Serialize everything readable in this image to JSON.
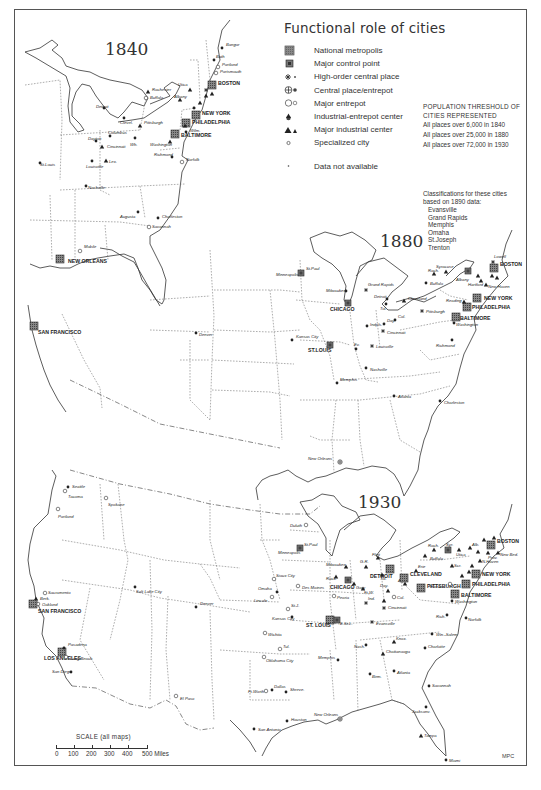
{
  "title": "Functional role of cities",
  "legend": [
    {
      "symbol": "national-metropolis",
      "label": "National metropolis"
    },
    {
      "symbol": "major-control-point",
      "label": "Major control point"
    },
    {
      "symbol": "high-order-central-place",
      "label": "High-order central place"
    },
    {
      "symbol": "central-place-entrepot",
      "label": "Central place/entrepot"
    },
    {
      "symbol": "major-entrepot",
      "label": "Major entrepot"
    },
    {
      "symbol": "industrial-entrepot-center",
      "label": "Industrial-entrepot center"
    },
    {
      "symbol": "major-industrial-center",
      "label": "Major industrial center"
    },
    {
      "symbol": "specialized-city",
      "label": "Specialized city"
    },
    {
      "symbol": "data-not-available",
      "label": "Data not available"
    }
  ],
  "threshold": {
    "heading_line1": "POPULATION THRESHOLD OF",
    "heading_line2": "CITIES REPRESENTED",
    "rows": [
      "All places over 6,000 in 1840",
      "All places over 25,000 in 1880",
      "All places over 72,000 in 1930"
    ]
  },
  "classifications": {
    "heading_line1": "Classifications for these cities",
    "heading_line2": "based on 1890 data:",
    "cities": [
      "Evansville",
      "Grand Rapids",
      "Memphis",
      "Omaha",
      "St.Joseph",
      "Trenton"
    ]
  },
  "maps": {
    "m1840": {
      "year": "1840",
      "cities": {
        "new_york": "NEW YORK",
        "philadelphia": "PHILADELPHIA",
        "baltimore": "BALTIMORE",
        "boston": "BOSTON",
        "new_orleans": "NEW ORLEANS",
        "san_francisco": "SAN FRANCISCO",
        "buffalo": "Buffalo",
        "rochester": "Rochester",
        "albany": "Albany",
        "utica": "Utica",
        "troy": "Troy",
        "pittsburgh": "Pittsburgh",
        "cleveland": "Clevel.",
        "detroit": "Detroit",
        "cincinnati": "Cincinnati",
        "louisville": "Louisville",
        "lexington": "Lex.",
        "st_louis": "St.Louis",
        "columbus": "Columbus",
        "dayton": "Dayton",
        "wheeling": "Wh.",
        "washington": "Washington",
        "richmond": "Richmond",
        "norfolk": "Norfolk",
        "nashville": "Nashville",
        "augusta": "Augusta",
        "charleston": "Charleston",
        "savannah": "Savannah",
        "mobile": "Mobile",
        "denver": "Denver",
        "portland": "Portland",
        "bangor": "Bangor",
        "bath": "Bath",
        "portsmouth": "Portsmouth",
        "salem": "Salem",
        "lowell": "Lowell",
        "providence": "Prov.",
        "newport": "New.",
        "hartford": "Hartf.",
        "new_haven": "N.Haven",
        "newark": "Newark",
        "lancaster": "Lanc.",
        "wilmington": "Wilm."
      }
    },
    "m1880": {
      "year": "1880",
      "cities": {
        "chicago": "CHICAGO",
        "st_louis": "ST.LOUIS",
        "new_york": "NEW YORK",
        "philadelphia": "PHILADELPHIA",
        "baltimore": "BALTIMORE",
        "boston": "BOSTON",
        "minneapolis": "Minneapolis",
        "st_paul": "St.Paul",
        "milwaukee": "Milwaukee",
        "grand_rapids": "Grand Rapids",
        "detroit": "Detroit",
        "toledo": "Tol.",
        "cleveland": "Cleveland",
        "buffalo": "Buffalo",
        "syracuse": "Syracuse",
        "rochester": "Roch.",
        "albany": "Albany",
        "pittsburgh": "Pittsburgh",
        "cincinnati": "Cincinnati",
        "indianapolis": "Indpls.",
        "dayton": "Day.",
        "columbus": "Col.",
        "louisville": "Louisville",
        "evansville": "Ev.",
        "kansas_city": "Kansas City",
        "memphis": "Memphis",
        "nashville": "Nashville",
        "atlanta": "Atlanta",
        "charleston": "Charleston",
        "richmond": "Richmond",
        "washington": "Washington",
        "reading": "Reading",
        "hartford": "Hartford",
        "new_haven": "New Haven",
        "lowell": "Lowell",
        "new_orleans": "New Orleans",
        "denver": "Denver",
        "providence": "Prov.",
        "worcester": "Worc."
      }
    },
    "m1930": {
      "year": "1930",
      "cities": {
        "seattle": "Seattle",
        "tacoma": "Tacoma",
        "spokane": "Spokane",
        "portland": "Portland",
        "sacramento": "Sacramento",
        "berkeley": "Berk.",
        "oakland": "Oakland",
        "san_francisco": "SAN FRANCISCO",
        "los_angeles": "LOS ANGELES",
        "pasadena": "Pasadena",
        "long_beach": "Long Beach",
        "san_diego": "San Diego",
        "salt_lake_city": "Salt Lake City",
        "denver": "Denver",
        "el_paso": "El Paso",
        "omaha": "Omaha",
        "lincoln": "Lincoln",
        "sioux_city": "Sioux City",
        "st_joseph": "St.J.",
        "kansas_city": "Kansas City",
        "wichita": "Wichita",
        "tulsa": "Tul.",
        "oklahoma_city": "Oklahoma City",
        "dallas": "Dallas",
        "fort_worth": "Ft.Worth",
        "houston": "Houston",
        "san_antonio": "San Antonio",
        "shreveport": "Shreve.",
        "new_orleans": "New Orleans",
        "duluth": "Duluth",
        "st_paul": "St.Paul",
        "minneapolis": "Minneapolis",
        "milwaukee": "Milwaukee",
        "chicago": "CHICAGO",
        "des_moines": "Des Moines",
        "peoria": "Peoria",
        "rockford": "Rock.",
        "gary": "Gary",
        "st_louis": "ST. LOUIS",
        "east_st_louis": "E.St.L.",
        "ft_wayne": "Ft.W.",
        "indianapolis": "Ind.",
        "evansville": "Evansville",
        "louisville": "Lou.",
        "cincinnati": "Cincinnati",
        "columbus": "Col.",
        "dayton": "Day.",
        "akron": "Akr.",
        "toledo": "Tol.",
        "detroit": "DETROIT",
        "flint": "Flint",
        "grand_rapids": "G.R.",
        "cleveland": "CLEVELAND",
        "pittsburgh": "PITTSBURGH",
        "erie": "Erie",
        "buffalo": "Buffalo",
        "rochester": "Roch.",
        "syracuse": "Syr.",
        "utica": "Utica",
        "albany": "Alb.",
        "scranton": "Scr.",
        "harrisburg": "Harris.",
        "new_york": "NEW YORK",
        "philadelphia": "PHILADELPHIA",
        "baltimore": "BALTIMORE",
        "washington": "Washington",
        "boston": "BOSTON",
        "new_bedford": "New Bed.",
        "providence": "Prov.",
        "new_haven": "N.Haven",
        "richmond": "Rich.",
        "norfolk": "Norfolk",
        "winston_salem": "Win.-Salem",
        "charlotte": "Charlotte",
        "knoxville": "Knox.",
        "chattanooga": "Chattanooga",
        "nashville": "Nash.",
        "memphis": "Memphis",
        "birmingham": "Birm.",
        "atlanta": "Atlanta",
        "savannah": "Savannah",
        "jacksonville": "Jacksonv.",
        "tampa": "Tampa",
        "miami": "Miami"
      }
    }
  },
  "scale": {
    "title": "SCALE (all maps)",
    "ticks": [
      "0",
      "100",
      "200",
      "300",
      "400",
      "500 Miles"
    ]
  },
  "credit": "MPC"
}
